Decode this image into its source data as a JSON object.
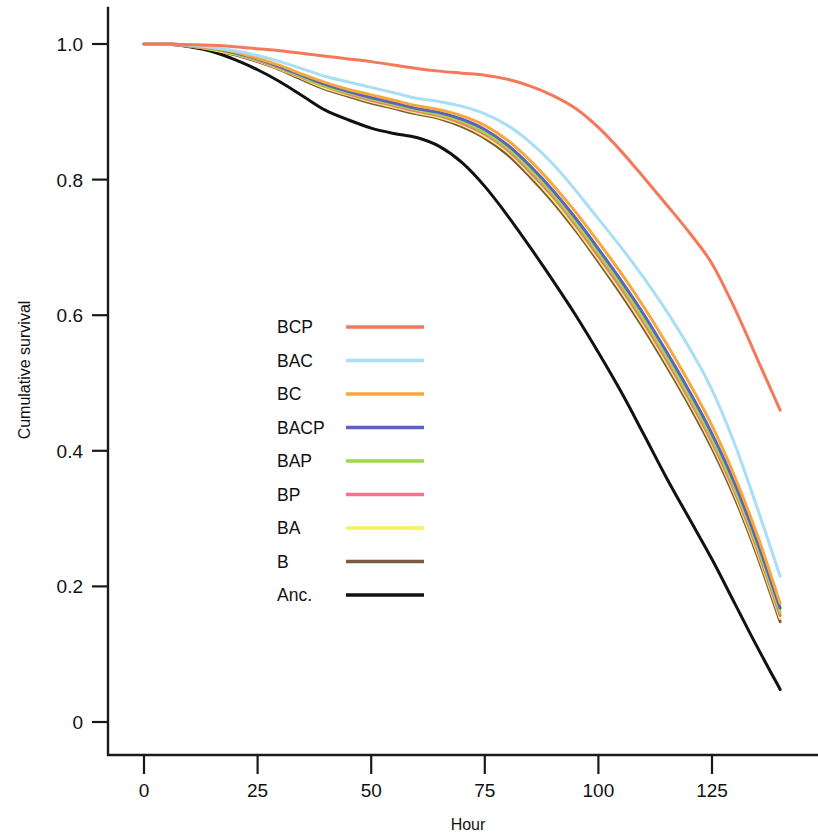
{
  "chart_data": {
    "type": "line",
    "title": "",
    "xlabel": "Hour",
    "ylabel": "Cumulative survival",
    "xlim": [
      0,
      140
    ],
    "ylim": [
      0,
      1.04
    ],
    "xticks": [
      0,
      25,
      50,
      75,
      100,
      125
    ],
    "xtick_labels": [
      "0",
      "25",
      "50",
      "75",
      "100",
      "125"
    ],
    "yticks": [
      0,
      0.2,
      0.4,
      0.6,
      0.8,
      1.0
    ],
    "ytick_labels": [
      "0",
      "0.2",
      "0.4",
      "0.6",
      "0.8",
      "1.0"
    ],
    "grid": false,
    "legend_position": "center-left",
    "x": [
      0,
      5,
      10,
      15,
      20,
      25,
      30,
      35,
      40,
      45,
      50,
      55,
      60,
      65,
      70,
      75,
      80,
      85,
      90,
      95,
      100,
      105,
      110,
      115,
      120,
      125,
      130,
      135,
      140
    ],
    "series": [
      {
        "name": "BCP",
        "color": "#F4795B",
        "values": [
          1.0,
          1.0,
          0.999,
          0.998,
          0.996,
          0.993,
          0.99,
          0.986,
          0.982,
          0.978,
          0.974,
          0.969,
          0.964,
          0.96,
          0.957,
          0.954,
          0.948,
          0.938,
          0.924,
          0.905,
          0.877,
          0.842,
          0.803,
          0.763,
          0.722,
          0.676,
          0.61,
          0.535,
          0.46
        ]
      },
      {
        "name": "BAC",
        "color": "#A8DFF5",
        "values": [
          1.0,
          1.0,
          0.998,
          0.995,
          0.99,
          0.983,
          0.974,
          0.963,
          0.952,
          0.944,
          0.936,
          0.928,
          0.92,
          0.915,
          0.908,
          0.897,
          0.88,
          0.855,
          0.823,
          0.784,
          0.742,
          0.7,
          0.655,
          0.606,
          0.552,
          0.49,
          0.41,
          0.315,
          0.215
        ]
      },
      {
        "name": "BC",
        "color": "#F5A93A",
        "values": [
          1.0,
          1.0,
          0.998,
          0.994,
          0.988,
          0.979,
          0.968,
          0.955,
          0.943,
          0.933,
          0.925,
          0.917,
          0.909,
          0.903,
          0.894,
          0.88,
          0.858,
          0.828,
          0.792,
          0.752,
          0.708,
          0.662,
          0.612,
          0.558,
          0.5,
          0.437,
          0.362,
          0.275,
          0.175
        ]
      },
      {
        "name": "BACP",
        "color": "#5B62C0",
        "values": [
          1.0,
          1.0,
          0.998,
          0.994,
          0.987,
          0.978,
          0.966,
          0.953,
          0.94,
          0.93,
          0.921,
          0.913,
          0.905,
          0.899,
          0.889,
          0.874,
          0.851,
          0.82,
          0.784,
          0.743,
          0.698,
          0.651,
          0.601,
          0.546,
          0.488,
          0.425,
          0.352,
          0.265,
          0.168
        ]
      },
      {
        "name": "BAP",
        "color": "#9ED94A",
        "values": [
          1.0,
          1.0,
          0.998,
          0.993,
          0.986,
          0.977,
          0.965,
          0.951,
          0.938,
          0.928,
          0.919,
          0.911,
          0.903,
          0.896,
          0.886,
          0.87,
          0.847,
          0.815,
          0.779,
          0.737,
          0.692,
          0.645,
          0.594,
          0.539,
          0.481,
          0.418,
          0.345,
          0.259,
          0.162
        ]
      },
      {
        "name": "BP",
        "color": "#F4728C",
        "values": [
          1.0,
          1.0,
          0.997,
          0.993,
          0.986,
          0.976,
          0.964,
          0.95,
          0.937,
          0.926,
          0.917,
          0.909,
          0.901,
          0.894,
          0.883,
          0.867,
          0.844,
          0.811,
          0.775,
          0.733,
          0.687,
          0.64,
          0.589,
          0.534,
          0.476,
          0.413,
          0.34,
          0.254,
          0.157
        ]
      },
      {
        "name": "BA",
        "color": "#F6F45A",
        "values": [
          1.0,
          1.0,
          0.997,
          0.992,
          0.985,
          0.975,
          0.963,
          0.949,
          0.935,
          0.925,
          0.915,
          0.907,
          0.899,
          0.892,
          0.881,
          0.864,
          0.841,
          0.808,
          0.771,
          0.729,
          0.683,
          0.636,
          0.585,
          0.53,
          0.472,
          0.409,
          0.336,
          0.25,
          0.153
        ]
      },
      {
        "name": "B",
        "color": "#7A5A44",
        "values": [
          1.0,
          1.0,
          0.997,
          0.992,
          0.984,
          0.974,
          0.962,
          0.947,
          0.933,
          0.923,
          0.913,
          0.905,
          0.897,
          0.89,
          0.878,
          0.861,
          0.837,
          0.804,
          0.767,
          0.725,
          0.679,
          0.631,
          0.58,
          0.525,
          0.467,
          0.404,
          0.331,
          0.245,
          0.148
        ]
      },
      {
        "name": "Anc.",
        "color": "#111111",
        "values": [
          1.0,
          1.0,
          0.996,
          0.989,
          0.977,
          0.962,
          0.944,
          0.923,
          0.902,
          0.888,
          0.876,
          0.868,
          0.862,
          0.849,
          0.825,
          0.79,
          0.747,
          0.7,
          0.651,
          0.6,
          0.545,
          0.487,
          0.424,
          0.36,
          0.3,
          0.24,
          0.175,
          0.11,
          0.048
        ]
      }
    ],
    "legend": [
      {
        "label": "BCP",
        "color": "#F4795B"
      },
      {
        "label": "BAC",
        "color": "#A8DFF5"
      },
      {
        "label": "BC",
        "color": "#F5A93A"
      },
      {
        "label": "BACP",
        "color": "#5B62C0"
      },
      {
        "label": "BAP",
        "color": "#9ED94A"
      },
      {
        "label": "BP",
        "color": "#F4728C"
      },
      {
        "label": "BA",
        "color": "#F6F45A"
      },
      {
        "label": "B",
        "color": "#7A5A44"
      },
      {
        "label": "Anc.",
        "color": "#111111"
      }
    ]
  }
}
